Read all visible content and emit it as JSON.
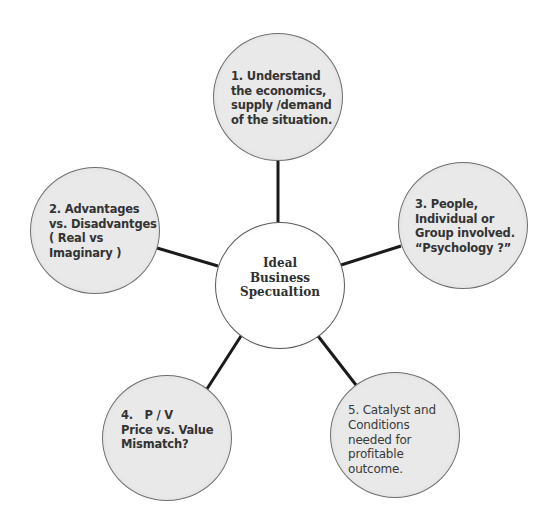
{
  "diagram": {
    "type": "hub-and-spoke mind map",
    "colors": {
      "background": "#ffffff",
      "outer_node_fill": "#e9e9e9",
      "center_node_fill": "#ffffff",
      "node_border": "#6e6e6e",
      "connector": "#1a1a1a",
      "text": "#3a3a3a"
    },
    "center": {
      "label": "Ideal\nBusiness\nSpecualtion"
    },
    "nodes": [
      {
        "id": 1,
        "position": "top",
        "label": "1. Understand\nthe economics,\nsupply /demand\nof the situation."
      },
      {
        "id": 2,
        "position": "left",
        "label": "2. Advantages\nvs. Disadvantges\n( Real vs\nImaginary )"
      },
      {
        "id": 3,
        "position": "right",
        "label": "3. People,\nIndividual or\nGroup involved.\n“Psychology ?”"
      },
      {
        "id": 4,
        "position": "bottom-left",
        "label": "4.   P / V\nPrice vs. Value\nMismatch?"
      },
      {
        "id": 5,
        "position": "bottom-right",
        "label": "5. Catalyst and\nConditions\nneeded for\nprofitable\noutcome."
      }
    ],
    "edges": [
      {
        "from": "center",
        "to": 1
      },
      {
        "from": "center",
        "to": 2
      },
      {
        "from": "center",
        "to": 3
      },
      {
        "from": "center",
        "to": 4
      },
      {
        "from": "center",
        "to": 5
      }
    ]
  }
}
